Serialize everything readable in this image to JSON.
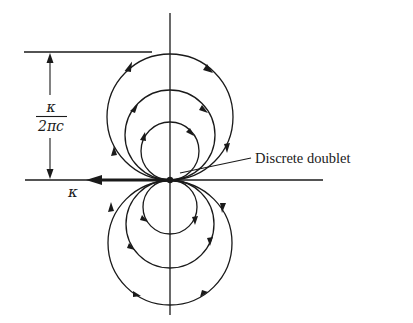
{
  "figure": {
    "labels": {
      "doublet": "Discrete doublet",
      "strength": "κ",
      "dimension_numerator": "κ",
      "dimension_denominator": "2πc"
    },
    "colors": {
      "ink": "#1a1a1a",
      "background": "#ffffff"
    },
    "geometry": {
      "origin": [
        170,
        180
      ],
      "upper_circles": [
        {
          "cx": 170,
          "cy": 117,
          "r": 63
        },
        {
          "cx": 170,
          "cy": 135,
          "r": 45
        },
        {
          "cx": 170,
          "cy": 151,
          "r": 29
        }
      ],
      "lower_circles": [
        {
          "cx": 170,
          "cy": 243,
          "r": 62
        },
        {
          "cx": 170,
          "cy": 224,
          "r": 44
        },
        {
          "cx": 170,
          "cy": 207,
          "r": 27
        }
      ],
      "upper_flow": "clockwise",
      "lower_flow": "counterclockwise"
    }
  }
}
